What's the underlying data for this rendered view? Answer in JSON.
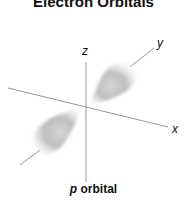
{
  "title": "Electron Orbitals",
  "axes": {
    "x_label": "x",
    "y_label": "y",
    "z_label": "z"
  },
  "caption": {
    "italic": "p",
    "rest": " orbital"
  },
  "colors": {
    "axis": "#8a8a8a",
    "lobe": "#b8b8b8",
    "text": "#111111"
  }
}
